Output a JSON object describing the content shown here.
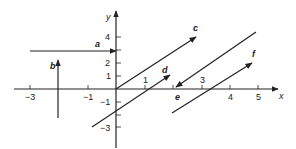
{
  "diagram": {
    "type": "vectors-on-cartesian-plane",
    "axes": {
      "x_label": "x",
      "y_label": "y",
      "x_tick_labels": [
        {
          "value": -3,
          "text": "−3"
        },
        {
          "value": -1,
          "text": "−1"
        },
        {
          "value": 1,
          "text": "1"
        },
        {
          "value": 3,
          "text": "3"
        },
        {
          "value": 4,
          "text": "4"
        },
        {
          "value": 5,
          "text": "5"
        }
      ],
      "y_tick_labels": [
        {
          "value": 4,
          "text": "4"
        },
        {
          "value": 2,
          "text": "2"
        },
        {
          "value": 1,
          "text": "1"
        },
        {
          "value": -1,
          "text": "−1"
        },
        {
          "value": -3,
          "text": "−3"
        }
      ]
    },
    "vectors": [
      {
        "name": "a",
        "label": "a",
        "from": [
          -3,
          3
        ],
        "to": [
          0,
          3
        ]
      },
      {
        "name": "b",
        "label": "b",
        "from": [
          -2,
          -2.2
        ],
        "to": [
          -2,
          2.2
        ]
      },
      {
        "name": "c",
        "label": "c",
        "from": [
          0,
          0
        ],
        "to": [
          2.8,
          4
        ]
      },
      {
        "name": "d",
        "label": "d",
        "from": [
          -0.85,
          -2.9
        ],
        "to": [
          1.9,
          1.1
        ]
      },
      {
        "name": "e",
        "label": "e",
        "from": [
          4.9,
          4.4
        ],
        "to": [
          2.1,
          0.1
        ]
      },
      {
        "name": "f",
        "label": "f",
        "from": [
          1.95,
          -1.85
        ],
        "to": [
          4.8,
          2
        ]
      }
    ]
  }
}
